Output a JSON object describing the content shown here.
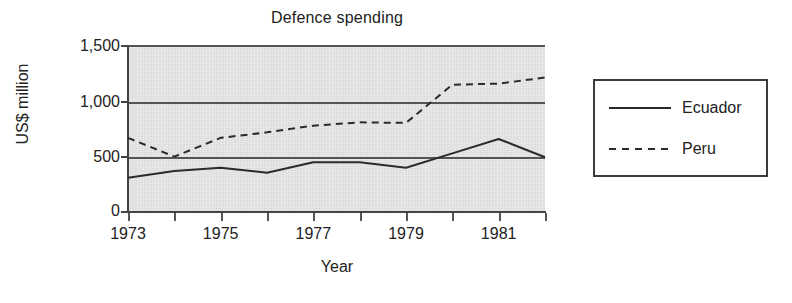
{
  "chart_data": {
    "type": "line",
    "title": "Defence spending",
    "xlabel": "Year",
    "ylabel": "US$ million",
    "x": [
      1973,
      1974,
      1975,
      1976,
      1977,
      1978,
      1979,
      1980,
      1981,
      1982
    ],
    "xtick_labels": [
      "1973",
      "",
      "1975",
      "",
      "1977",
      "",
      "1979",
      "",
      "1981",
      ""
    ],
    "xlim": [
      1973,
      1982
    ],
    "ylim": [
      0,
      1500
    ],
    "ytick_values": [
      0,
      500,
      1000,
      1500
    ],
    "ytick_labels": [
      "0",
      "500",
      "1,000",
      "1,500"
    ],
    "grid": "horizontal",
    "legend_position": "right-outside",
    "plot_background": "#dcdcdc",
    "line_color": "#2b2b2b",
    "series": [
      {
        "name": "Ecuador",
        "style": "solid",
        "values": [
          310,
          370,
          400,
          355,
          450,
          450,
          400,
          530,
          660,
          495
        ]
      },
      {
        "name": "Peru",
        "style": "dashed",
        "values": [
          670,
          500,
          670,
          720,
          780,
          810,
          805,
          1150,
          1160,
          1215
        ]
      }
    ]
  },
  "legend": {
    "items": [
      {
        "label": "Ecuador",
        "style": "solid"
      },
      {
        "label": "Peru",
        "style": "dashed"
      }
    ]
  }
}
